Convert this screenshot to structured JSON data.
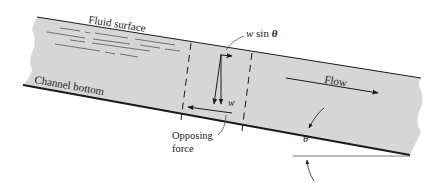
{
  "diagram": {
    "labels": {
      "fluid_surface": "Fluid surface",
      "channel_bottom": "Channel bottom",
      "flow": "Flow",
      "w_sin_theta_w": "w",
      "w_sin_theta_sin": " sin ",
      "w_sin_theta_theta": "θ",
      "w": "w",
      "opposing_line1": "Opposing",
      "opposing_line2": "force",
      "theta": "θ"
    },
    "colors": {
      "fluid_fill": "#d6d6d6",
      "line": "#1a1a1a",
      "background": "#ffffff"
    }
  }
}
